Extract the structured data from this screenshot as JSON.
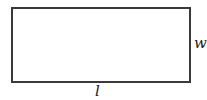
{
  "diagram": {
    "shape": "rectangle",
    "labels": {
      "width": "w",
      "length": "l"
    },
    "colors": {
      "stroke": "#3a3a3a",
      "text": "#222222",
      "background": "#ffffff"
    }
  }
}
